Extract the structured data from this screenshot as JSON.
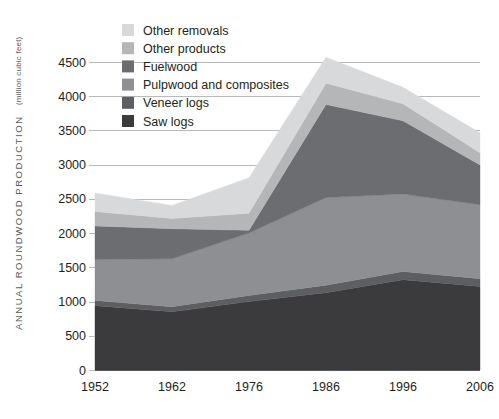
{
  "chart_data": {
    "type": "area",
    "title": "",
    "subtitle": "",
    "xlabel": "",
    "ylabel": "ANNUAL ROUNDWOOD PRODUCTION",
    "ylabel_units": "(million cubic feet)",
    "categories": [
      "1952",
      "1962",
      "1976",
      "1986",
      "1996",
      "2006"
    ],
    "x": [
      1952,
      1962,
      1976,
      1986,
      1996,
      2006
    ],
    "ylim": [
      0,
      4750
    ],
    "yticks": [
      0,
      500,
      1000,
      1500,
      2000,
      2500,
      3000,
      3500,
      4000,
      4500
    ],
    "ytick_labels": [
      "0",
      "500",
      "1000",
      "1500",
      "2000",
      "2500",
      "3000",
      "3500",
      "4000",
      "4500"
    ],
    "grid": true,
    "stacked": true,
    "legend_position": "top-left",
    "series": [
      {
        "name": "Saw logs",
        "color": "#3b3b3d",
        "values": [
          940,
          850,
          1000,
          1130,
          1320,
          1220
        ]
      },
      {
        "name": "Veneer logs",
        "color": "#5d5e61",
        "values": [
          75,
          75,
          90,
          110,
          120,
          115
        ]
      },
      {
        "name": "Pulpwood and composites",
        "color": "#8e8f92",
        "values": [
          600,
          700,
          910,
          1280,
          1130,
          1080
        ]
      },
      {
        "name": "Fuelwood",
        "color": "#6c6d70",
        "values": [
          490,
          440,
          40,
          1360,
          1070,
          580
        ]
      },
      {
        "name": "Other products",
        "color": "#b5b6b8",
        "values": [
          210,
          150,
          250,
          310,
          250,
          180
        ]
      },
      {
        "name": "Other removals",
        "color": "#d8d9da",
        "values": [
          270,
          190,
          520,
          380,
          240,
          290
        ]
      }
    ],
    "stack_totals": [
      2585,
      2405,
      2810,
      4570,
      4130,
      3465
    ],
    "legend_order": [
      "Other removals",
      "Other products",
      "Fuelwood",
      "Pulpwood and composites",
      "Veneer logs",
      "Saw logs"
    ]
  },
  "legend": {
    "items": [
      {
        "label": "Other removals",
        "color": "#d8d9da"
      },
      {
        "label": "Other products",
        "color": "#b5b6b8"
      },
      {
        "label": "Fuelwood",
        "color": "#6c6d70"
      },
      {
        "label": "Pulpwood and composites",
        "color": "#8e8f92"
      },
      {
        "label": "Veneer logs",
        "color": "#5d5e61"
      },
      {
        "label": "Saw logs",
        "color": "#3b3b3d"
      }
    ]
  },
  "colors": {
    "background": "#ffffff",
    "gridline": "#b9babc",
    "axis": "#58595b",
    "text": "#231f20",
    "axis_title": "#58595b"
  }
}
